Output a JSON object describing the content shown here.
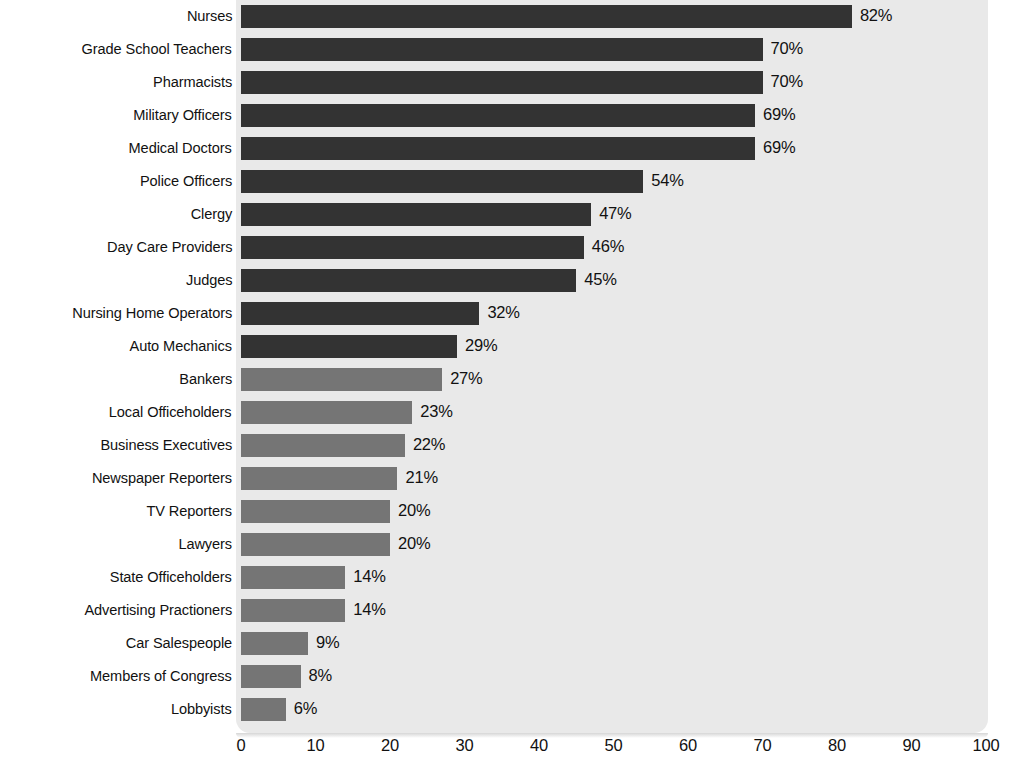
{
  "chart_data": {
    "type": "bar",
    "orientation": "horizontal",
    "title": "",
    "subtitle": "",
    "xlabel": "",
    "ylabel": "",
    "xlim": [
      0,
      100
    ],
    "xticks": [
      0,
      10,
      20,
      30,
      40,
      50,
      60,
      70,
      80,
      90,
      100
    ],
    "grid": false,
    "legend": "none",
    "value_suffix": "%",
    "categories": [
      "Nurses",
      "Grade School Teachers",
      "Pharmacists",
      "Military Officers",
      "Medical Doctors",
      "Police Officers",
      "Clergy",
      "Day Care Providers",
      "Judges",
      "Nursing Home Operators",
      "Auto Mechanics",
      "Bankers",
      "Local Officeholders",
      "Business Executives",
      "Newspaper Reporters",
      "TV Reporters",
      "Lawyers",
      "State Officeholders",
      "Advertising Practioners",
      "Car Salespeople",
      "Members of Congress",
      "Lobbyists"
    ],
    "values": [
      82,
      70,
      70,
      69,
      69,
      54,
      47,
      46,
      45,
      32,
      29,
      27,
      23,
      22,
      21,
      20,
      20,
      14,
      14,
      9,
      8,
      6
    ],
    "value_labels": [
      "82%",
      "70%",
      "70%",
      "69%",
      "69%",
      "54%",
      "47%",
      "46%",
      "45%",
      "32%",
      "29%",
      "27%",
      "23%",
      "22%",
      "21%",
      "20%",
      "20%",
      "14%",
      "14%",
      "9%",
      "8%",
      "6%"
    ],
    "bar_colors": [
      "#333333",
      "#333333",
      "#333333",
      "#333333",
      "#333333",
      "#333333",
      "#333333",
      "#333333",
      "#333333",
      "#333333",
      "#333333",
      "#757575",
      "#757575",
      "#757575",
      "#757575",
      "#757575",
      "#757575",
      "#757575",
      "#757575",
      "#757575",
      "#757575",
      "#757575"
    ],
    "tick_labels": [
      "0",
      "10",
      "20",
      "30",
      "40",
      "50",
      "60",
      "70",
      "80",
      "90",
      "100"
    ]
  },
  "style": {
    "page_background": "#ffffff",
    "plot_background": "#e9e9e9",
    "dark_bar_color": "#333333",
    "light_bar_color": "#757575",
    "text_color": "#111111"
  }
}
